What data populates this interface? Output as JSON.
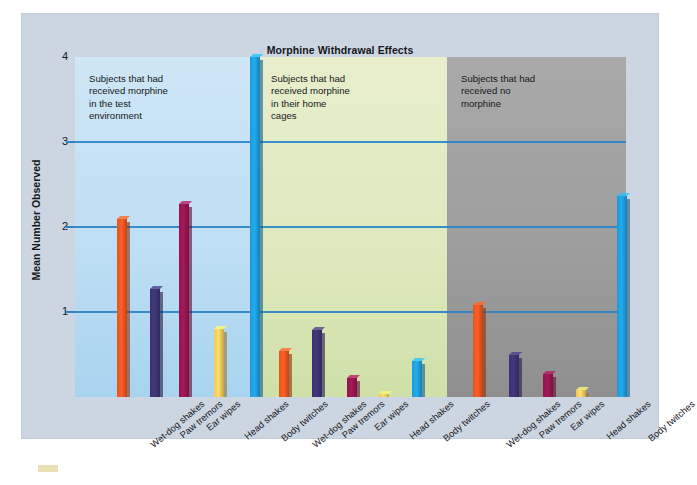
{
  "chart_data": {
    "type": "bar",
    "title": "Morphine Withdrawal Effects",
    "xlabel": "",
    "ylabel": "Mean Number Observed",
    "ylim": [
      0,
      4
    ],
    "yticks": [
      1,
      2,
      3,
      4
    ],
    "grid": "horizontal",
    "legend": "none",
    "categories": [
      "Wet-dog shakes",
      "Paw tremors",
      "Ear wipes",
      "Head shakes",
      "Body twitches"
    ],
    "groups": [
      {
        "name": "Subjects that had received morphine in the test environment",
        "annotation": "Subjects that had\nreceived morphine\nin the test\nenvironment",
        "panel_color": "#c3e1f4",
        "values": [
          2.1,
          1.27,
          2.27,
          0.8,
          4.0
        ]
      },
      {
        "name": "Subjects that had received morphine in their home cages",
        "annotation": "Subjects that had\nreceived morphine\nin their home\ncages",
        "panel_color": "#e0e9c2",
        "values": [
          0.54,
          0.79,
          0.22,
          0.03,
          0.42
        ]
      },
      {
        "name": "Subjects that had received no morphine",
        "annotation": "Subjects that had\nreceived no\nmorphine",
        "panel_color": "#9d9d9d",
        "values": [
          1.08,
          0.5,
          0.27,
          0.08,
          2.37
        ]
      }
    ],
    "bar_colors": {
      "Wet-dog shakes": "#e4541f",
      "Paw tremors": "#3c3270",
      "Ear wipes": "#94154e",
      "Head shakes": "#f2c košt",
      "Body twitches": "#1e9ad6"
    },
    "series_colors": [
      "#e4541f",
      "#3c3270",
      "#94154e",
      "#f2c75c",
      "#1e9ad6"
    ],
    "axis_color": "#2b86c8"
  },
  "figure": {
    "title": "Morphine Withdrawal Effects",
    "y_axis_label": "Mean Number Observed",
    "y_ticks": [
      "4",
      "3",
      "2",
      "1"
    ],
    "panels": [
      {
        "note": "Subjects that had\nreceived morphine\nin the test\nenvironment"
      },
      {
        "note": "Subjects that had\nreceived morphine\nin their home\ncages"
      },
      {
        "note": "Subjects that had\nreceived no\nmorphine"
      }
    ],
    "x_labels": [
      "Wet-dog shakes",
      "Paw tremors",
      "Ear wipes",
      "Head shakes",
      "Body twitches",
      "Wet-dog shakes",
      "Paw tremors",
      "Ear wipes",
      "Head shakes",
      "Body twitches",
      "Wet-dog shakes",
      "Paw tremors",
      "Ear wipes",
      "Head shakes",
      "Body twitches"
    ]
  }
}
